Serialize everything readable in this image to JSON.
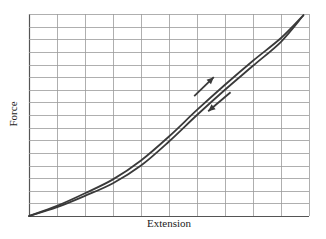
{
  "chart_data": {
    "type": "line",
    "title": "",
    "xlabel": "Extension",
    "ylabel": "Force",
    "xlim": [
      0,
      10
    ],
    "ylim": [
      0,
      16
    ],
    "grid": true,
    "grid_divisions": {
      "x": 10,
      "y": 16
    },
    "tick_labels": {
      "x": [],
      "y": []
    },
    "legend": null,
    "series": [
      {
        "name": "Loading",
        "direction": "up",
        "x": [
          0,
          1,
          2,
          3,
          4,
          5,
          6,
          7,
          8,
          9,
          9.8
        ],
        "y": [
          0,
          0.8,
          1.8,
          2.9,
          4.4,
          6.3,
          8.4,
          10.4,
          12.3,
          14.1,
          15.9
        ]
      },
      {
        "name": "Unloading",
        "direction": "down",
        "x": [
          0,
          1,
          2,
          3,
          4,
          5,
          6,
          7,
          8,
          9,
          9.8
        ],
        "y": [
          0,
          0.7,
          1.6,
          2.6,
          4.0,
          5.9,
          8.0,
          10.0,
          11.9,
          13.8,
          15.9
        ]
      }
    ],
    "annotations": [
      {
        "type": "arrow",
        "label": "loading direction",
        "from": [
          5.9,
          9.5
        ],
        "to": [
          6.6,
          11.0
        ]
      },
      {
        "type": "arrow",
        "label": "unloading direction",
        "from": [
          7.2,
          9.8
        ],
        "to": [
          6.4,
          8.3
        ]
      }
    ]
  },
  "colors": {
    "curve": "#3a3a3a",
    "grid": "#9a9a9a",
    "background": "#ffffff"
  }
}
